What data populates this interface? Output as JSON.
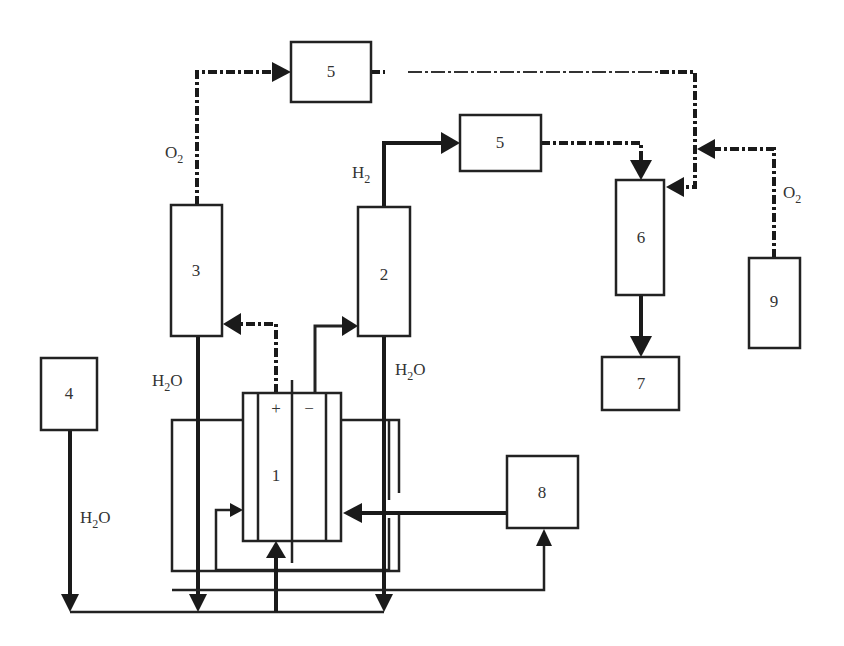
{
  "diagram": {
    "type": "process flow schematic",
    "components": [
      {
        "id": "1",
        "label": "1",
        "terminals": {
          "positive": "+",
          "negative": "−"
        }
      },
      {
        "id": "2",
        "label": "2"
      },
      {
        "id": "3",
        "label": "3"
      },
      {
        "id": "4",
        "label": "4"
      },
      {
        "id": "5a",
        "label": "5"
      },
      {
        "id": "5b",
        "label": "5"
      },
      {
        "id": "6",
        "label": "6"
      },
      {
        "id": "7",
        "label": "7"
      },
      {
        "id": "8",
        "label": "8"
      },
      {
        "id": "9",
        "label": "9"
      }
    ],
    "labels": {
      "o2_left": {
        "base": "O",
        "sub": "2"
      },
      "o2_right": {
        "base": "O",
        "sub": "2"
      },
      "h2": {
        "base": "H",
        "sub": "2"
      },
      "h2o_left": {
        "base": "H",
        "sub": "2",
        "tail": "O"
      },
      "h2o_right": {
        "base": "H",
        "sub": "2",
        "tail": "O"
      },
      "h2o_bottom": {
        "base": "H",
        "sub": "2",
        "tail": "O"
      }
    },
    "flows": [
      {
        "from": "1 (+)",
        "to": "3",
        "style": "dash-dot"
      },
      {
        "from": "1 (−)",
        "to": "2",
        "style": "solid"
      },
      {
        "from": "3",
        "to": "5 (top)",
        "style": "dash-dot",
        "label": "O2"
      },
      {
        "from": "2",
        "to": "5 (middle)",
        "style": "solid",
        "label": "H2"
      },
      {
        "from": "5 (top)",
        "to": "6",
        "style": "dash-dot"
      },
      {
        "from": "5 (middle)",
        "to": "6",
        "style": "dash-dot"
      },
      {
        "from": "9",
        "to": "6",
        "style": "dash-dot",
        "label": "O2"
      },
      {
        "from": "6",
        "to": "7",
        "style": "solid"
      },
      {
        "from": "4",
        "to": "1",
        "style": "solid",
        "label": "H2O"
      },
      {
        "from": "3",
        "to": "1",
        "style": "solid",
        "label": "H2O"
      },
      {
        "from": "2",
        "to": "1",
        "style": "solid",
        "label": "H2O"
      },
      {
        "from": "8",
        "to": "1",
        "style": "solid"
      },
      {
        "from": "bath",
        "to": "8",
        "style": "solid"
      }
    ]
  }
}
